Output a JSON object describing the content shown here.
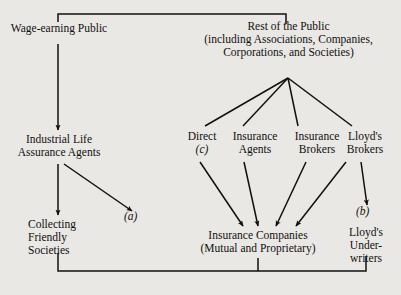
{
  "diagram": {
    "type": "flow-chart",
    "ink_color": "#111010",
    "background_color": "#e9e8e4",
    "nodes": {
      "wage_earning_public": {
        "lines": [
          "Wage-earning Public"
        ]
      },
      "rest_of_public": {
        "lines": [
          "Rest of the Public",
          "(including Associations, Companies,",
          "Corporations, and Societies)"
        ]
      },
      "industrial_life_agents": {
        "lines": [
          "Industrial Life",
          "Assurance Agents"
        ]
      },
      "direct": {
        "lines": [
          "Direct"
        ],
        "note": "(c)"
      },
      "insurance_agents": {
        "lines": [
          "Insurance",
          "Agents"
        ]
      },
      "insurance_brokers": {
        "lines": [
          "Insurance",
          "Brokers"
        ]
      },
      "lloyds_brokers": {
        "lines": [
          "Lloyd's",
          "Brokers"
        ]
      },
      "collecting_friendly_societies": {
        "lines": [
          "Collecting",
          "Friendly",
          "Societies"
        ]
      },
      "insurance_companies": {
        "lines": [
          "Insurance Companies",
          "(Mutual and Proprietary)"
        ]
      },
      "lloyds_underwriters": {
        "lines": [
          "Lloyd's",
          "Under-",
          "writers"
        ]
      }
    },
    "annotations": {
      "a": "(a)",
      "b": "(b)",
      "c": "(c)"
    }
  }
}
